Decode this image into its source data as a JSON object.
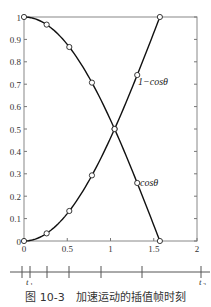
{
  "chart_data": {
    "type": "line",
    "title": "",
    "xlabel": "",
    "ylabel": "",
    "xlim": [
      0,
      2
    ],
    "ylim": [
      0,
      1
    ],
    "x_ticks": [
      "0",
      "0.5",
      "1",
      "1.5",
      "2"
    ],
    "y_ticks": [
      "0",
      "0.1",
      "0.2",
      "0.3",
      "0.4",
      "0.5",
      "0.6",
      "0.7",
      "0.8",
      "0.9",
      "1"
    ],
    "grid": false,
    "x": [
      0,
      0.2618,
      0.5236,
      0.7854,
      1.0472,
      1.309,
      1.5708
    ],
    "series": [
      {
        "name": "cosθ",
        "label_text": "cosθ",
        "values": [
          1,
          0.966,
          0.866,
          0.707,
          0.5,
          0.259,
          0
        ]
      },
      {
        "name": "1−cosθ",
        "label_text": "1−cosθ",
        "values": [
          0,
          0.034,
          0.134,
          0.293,
          0.5,
          0.741,
          1
        ]
      }
    ],
    "timeline": {
      "start_label": "t",
      "start_sub": "1",
      "end_label": "t",
      "end_sub": "2"
    }
  },
  "caption": "图 10-3　加速运动的插值帧时刻"
}
